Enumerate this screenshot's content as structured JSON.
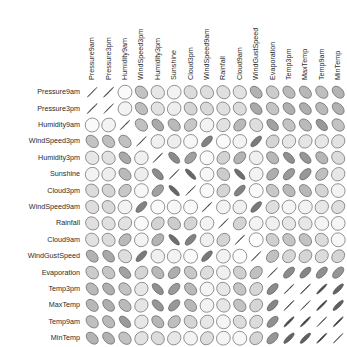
{
  "figure": {
    "kind": "correlation-matrix-ellipse-plot",
    "background": "#ffffff",
    "label_color": "#2b2b2b"
  },
  "chart_data": {
    "type": "heatmap",
    "title": "",
    "subtitle": "",
    "xlabel": "",
    "ylabel": "",
    "grid": false,
    "legend": "none",
    "matrix_style": "ellipse",
    "value_range": [
      -1,
      1
    ],
    "color_scale_low": "#1a1a1a",
    "color_scale_mid": "#ffffff",
    "color_scale_high": "#1a1a1a",
    "note": "Ellipse orientation encodes sign (/ = positive, \\ = negative); narrowness and darkness encode magnitude.",
    "categories": [
      "Pressure9am",
      "Pressure3pm",
      "Humidity9am",
      "WindSpeed3pm",
      "Humidity3pm",
      "Sunshine",
      "Cloud3pm",
      "WindSpeed9am",
      "Rainfall",
      "Cloud9am",
      "WindGustSpeed",
      "Evaporation",
      "Temp3pm",
      "MaxTemp",
      "Temp9am",
      "MinTemp"
    ],
    "x_tick_labels": [
      "Pressure9am",
      "Pressure3pm",
      "Humidity9am",
      "WindSpeed3pm",
      "Humidity3pm",
      "Sunshine",
      "Cloud3pm",
      "WindSpeed9am",
      "Rainfall",
      "Cloud9am",
      "WindGustSpeed",
      "Evaporation",
      "Temp3pm",
      "MaxTemp",
      "Temp9am",
      "MinTemp"
    ],
    "y_tick_labels": [
      "Pressure9am",
      "Pressure3pm",
      "Humidity9am",
      "WindSpeed3pm",
      "Humidity3pm",
      "Sunshine",
      "Cloud3pm",
      "WindSpeed9am",
      "Rainfall",
      "Cloud9am",
      "WindGustSpeed",
      "Evaporation",
      "Temp3pm",
      "MaxTemp",
      "Temp9am",
      "MinTemp"
    ],
    "values": [
      [
        1.0,
        0.96,
        0.02,
        -0.26,
        -0.1,
        0.05,
        -0.15,
        -0.14,
        -0.13,
        -0.12,
        -0.34,
        -0.22,
        -0.3,
        -0.31,
        -0.28,
        -0.33
      ],
      [
        0.96,
        1.0,
        0.05,
        -0.28,
        -0.12,
        0.07,
        -0.18,
        -0.16,
        -0.13,
        -0.15,
        -0.38,
        -0.25,
        -0.35,
        -0.36,
        -0.3,
        -0.34
      ],
      [
        0.02,
        0.05,
        1.0,
        -0.27,
        -0.38,
        -0.3,
        0.24,
        0.05,
        0.12,
        0.3,
        -0.14,
        -0.42,
        -0.26,
        -0.3,
        -0.45,
        -0.26
      ],
      [
        -0.26,
        -0.28,
        -0.27,
        1.0,
        0.06,
        0.07,
        0.03,
        0.56,
        0.02,
        0.05,
        0.6,
        0.18,
        0.1,
        0.11,
        0.1,
        0.12
      ],
      [
        -0.1,
        -0.12,
        -0.38,
        0.06,
        1.0,
        -0.52,
        0.42,
        0.02,
        0.19,
        0.33,
        -0.06,
        -0.31,
        -0.5,
        -0.47,
        -0.32,
        -0.15
      ],
      [
        0.05,
        0.07,
        -0.3,
        0.07,
        -0.52,
        1.0,
        -0.7,
        -0.03,
        -0.22,
        -0.66,
        0.05,
        0.36,
        0.45,
        0.46,
        0.28,
        0.1
      ],
      [
        -0.15,
        -0.18,
        0.24,
        0.03,
        0.42,
        -0.7,
        1.0,
        0.02,
        0.18,
        0.56,
        -0.02,
        -0.24,
        -0.3,
        -0.31,
        -0.18,
        -0.05
      ],
      [
        -0.14,
        -0.16,
        0.05,
        0.56,
        0.02,
        -0.03,
        0.02,
        1.0,
        0.05,
        0.06,
        0.61,
        0.14,
        0.04,
        0.05,
        0.1,
        0.14
      ],
      [
        -0.13,
        -0.13,
        0.12,
        0.02,
        0.19,
        -0.22,
        0.18,
        0.05,
        1.0,
        0.18,
        0.05,
        -0.06,
        -0.1,
        -0.1,
        -0.04,
        0.04
      ],
      [
        -0.12,
        -0.15,
        0.3,
        0.05,
        0.33,
        -0.66,
        0.56,
        0.06,
        0.18,
        1.0,
        -0.01,
        -0.2,
        -0.25,
        -0.26,
        -0.15,
        -0.03
      ],
      [
        -0.34,
        -0.38,
        -0.14,
        0.6,
        -0.06,
        0.05,
        -0.02,
        0.61,
        0.05,
        -0.01,
        1.0,
        0.27,
        0.17,
        0.18,
        0.15,
        0.18
      ],
      [
        -0.22,
        -0.25,
        -0.42,
        0.18,
        -0.31,
        0.36,
        -0.24,
        0.14,
        -0.06,
        -0.2,
        0.27,
        1.0,
        0.52,
        0.55,
        0.5,
        0.47
      ],
      [
        -0.3,
        -0.35,
        -0.26,
        0.1,
        -0.5,
        0.45,
        -0.3,
        0.04,
        -0.1,
        -0.25,
        0.17,
        0.52,
        1.0,
        0.96,
        0.84,
        0.71
      ],
      [
        -0.31,
        -0.36,
        -0.3,
        0.11,
        -0.47,
        0.46,
        -0.31,
        0.05,
        -0.1,
        -0.26,
        0.18,
        0.55,
        0.96,
        1.0,
        0.86,
        0.73
      ],
      [
        -0.28,
        -0.3,
        -0.45,
        0.1,
        -0.32,
        0.28,
        -0.18,
        0.1,
        -0.04,
        -0.15,
        0.15,
        0.5,
        0.84,
        0.86,
        1.0,
        0.9
      ],
      [
        -0.33,
        -0.34,
        -0.26,
        0.12,
        -0.15,
        0.1,
        -0.05,
        0.14,
        0.04,
        -0.03,
        0.18,
        0.47,
        0.71,
        0.73,
        0.9,
        1.0
      ]
    ]
  },
  "layout": {
    "grid_left": 84,
    "grid_top": 84,
    "cell_size": 16.4,
    "n": 16,
    "col_label_baseline": 80,
    "row_label_right": 80
  }
}
